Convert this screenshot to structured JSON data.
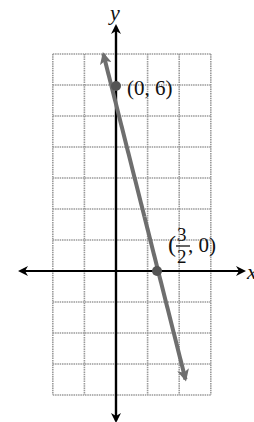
{
  "chart_data": {
    "type": "line",
    "title": "",
    "xlabel": "x",
    "ylabel": "y",
    "xlim": [
      -2,
      3
    ],
    "ylim": [
      -4,
      7
    ],
    "grid": true,
    "legend": null,
    "series": [
      {
        "name": "line",
        "equation": "y = -4x + 6",
        "x": [
          -0.4,
          0,
          1.5,
          2.2
        ],
        "y": [
          7.0,
          6,
          0,
          -3.5
        ],
        "color": "#6e6e6e"
      }
    ],
    "points": [
      {
        "x": 0,
        "y": 6,
        "label_text": "(0, 6)"
      },
      {
        "x": 1.5,
        "y": 0,
        "label_prefix": "(",
        "label_num": "3",
        "label_den": "2",
        "label_suffix": ", 0)"
      }
    ]
  },
  "axes": {
    "x_label": "x",
    "y_label": "y"
  },
  "colors": {
    "grid": "#9a9a9a",
    "axis": "#000000",
    "line": "#6e6e6e"
  }
}
